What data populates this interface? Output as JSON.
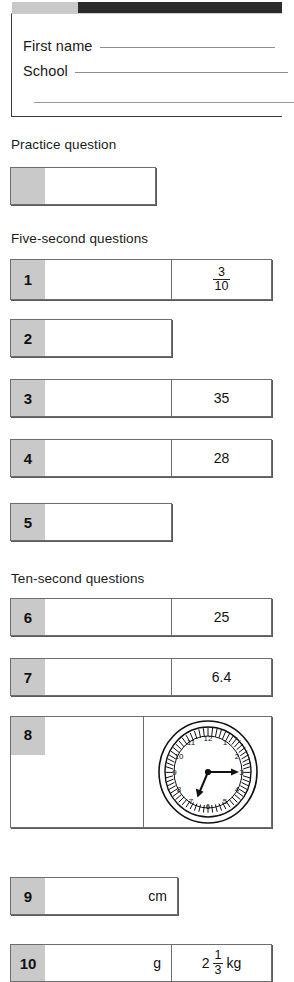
{
  "topbar": {
    "light_color": "#c9c9c9",
    "dark_color": "#2b2b2b"
  },
  "form": {
    "first_name_label": "First name",
    "school_label": "School",
    "first_name_value": "",
    "school_value": "",
    "extra_line_value": ""
  },
  "sections": {
    "practice_heading": "Practice question",
    "five_second_heading": "Five-second questions",
    "ten_second_heading": "Ten-second questions"
  },
  "practice": {
    "number": "",
    "answer": ""
  },
  "questions": [
    {
      "number": "1",
      "answer": "",
      "side_type": "fraction",
      "side_numerator": "3",
      "side_denominator": "10"
    },
    {
      "number": "2",
      "answer": "",
      "side_type": "none"
    },
    {
      "number": "3",
      "answer": "",
      "side_type": "text",
      "side_text": "35"
    },
    {
      "number": "4",
      "answer": "",
      "side_type": "text",
      "side_text": "28"
    },
    {
      "number": "5",
      "answer": "",
      "side_type": "none"
    },
    {
      "number": "6",
      "answer": "",
      "side_type": "text",
      "side_text": "25"
    },
    {
      "number": "7",
      "answer": "",
      "side_type": "text",
      "side_text": "6.4"
    },
    {
      "number": "8",
      "answer": "",
      "side_type": "clock"
    },
    {
      "number": "9",
      "answer": "cm",
      "side_type": "none"
    },
    {
      "number": "10",
      "answer": "g",
      "side_type": "mixed",
      "side_whole": "2",
      "side_numerator": "1",
      "side_denominator": "3",
      "side_unit": "kg"
    }
  ],
  "clock": {
    "hour_labels": [
      "1",
      "2",
      "3",
      "4",
      "5",
      "6",
      "7",
      "8",
      "9",
      "10",
      "11",
      "12"
    ],
    "minute_hand_points_to": "3",
    "hour_hand_points_to": "between 6 and 7",
    "reads": "6:15"
  }
}
